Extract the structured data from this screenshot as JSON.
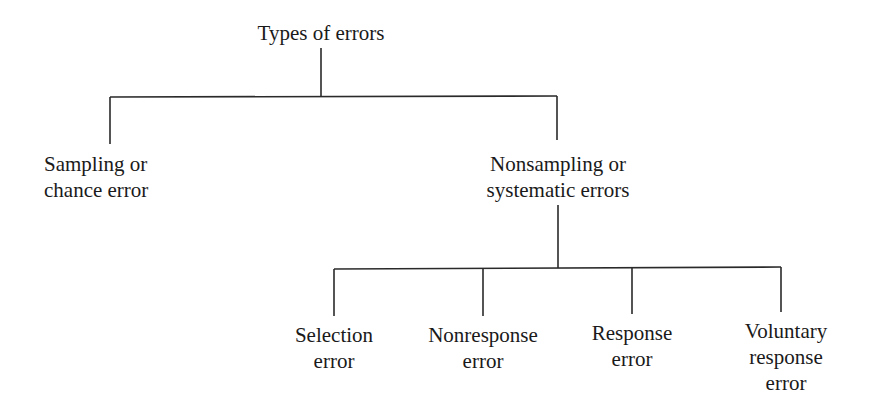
{
  "diagram": {
    "type": "tree",
    "root": {
      "label": [
        "Types of errors"
      ],
      "children": [
        {
          "label": [
            "Sampling or",
            "chance error"
          ],
          "children": []
        },
        {
          "label": [
            "Nonsampling or",
            "systematic errors"
          ],
          "children": [
            {
              "label": [
                "Selection",
                "error"
              ]
            },
            {
              "label": [
                "Nonresponse",
                "error"
              ]
            },
            {
              "label": [
                "Response",
                "error"
              ]
            },
            {
              "label": [
                "Voluntary",
                "response",
                "error"
              ]
            }
          ]
        }
      ]
    }
  },
  "colors": {
    "line": "#2a2a2a",
    "text": "#1a1a1a",
    "background": "#ffffff"
  }
}
